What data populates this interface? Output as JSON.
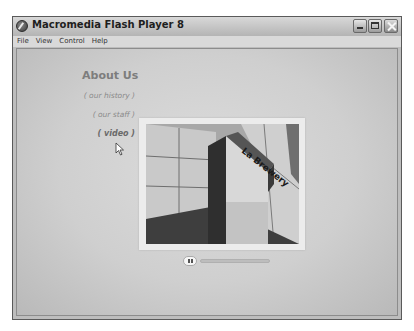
{
  "window": {
    "title": "Macromedia Flash Player 8",
    "controls": [
      "minimize",
      "maximize",
      "close"
    ]
  },
  "menubar": {
    "items": [
      {
        "label": "File"
      },
      {
        "label": "View"
      },
      {
        "label": "Control"
      },
      {
        "label": "Help"
      }
    ]
  },
  "content": {
    "heading": "About Us",
    "nav": [
      {
        "label": "( our history )",
        "active": false
      },
      {
        "label": "( our staff )",
        "active": false
      },
      {
        "label": "( video )",
        "active": true
      }
    ],
    "photo": {
      "description": "building with sign",
      "sign_text": "La Brewery"
    },
    "player": {
      "state": "playing",
      "progress_percent": 2
    }
  },
  "colors": {
    "stage_bg": "#d4d4d4",
    "heading": "#7d7d7d",
    "link": "#8a8a8a",
    "active_link": "#6a6a6a"
  }
}
